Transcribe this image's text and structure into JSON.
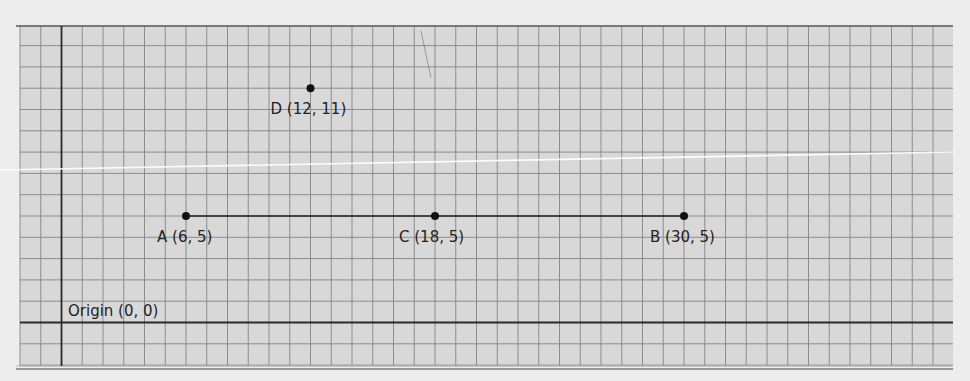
{
  "diagram": {
    "type": "coordinate-grid",
    "colors": {
      "page_background": "#ededed",
      "grid_background": "#d8d8d8",
      "grid_line": "#8c8c8c",
      "axis_line": "#2a2a2a",
      "segment": "#1e1e1e",
      "point": "#111111",
      "label": "#222222"
    },
    "origin_label": "Origin (0, 0)",
    "points": [
      {
        "id": "A",
        "label": "A (6, 5)",
        "x": 6,
        "y": 5
      },
      {
        "id": "C",
        "label": "C (18, 5)",
        "x": 18,
        "y": 5
      },
      {
        "id": "B",
        "label": "B (30, 5)",
        "x": 30,
        "y": 5
      },
      {
        "id": "D",
        "label": "D (12, 11)",
        "x": 12,
        "y": 11
      }
    ],
    "segments": [
      {
        "from": "A",
        "to": "B"
      }
    ]
  }
}
